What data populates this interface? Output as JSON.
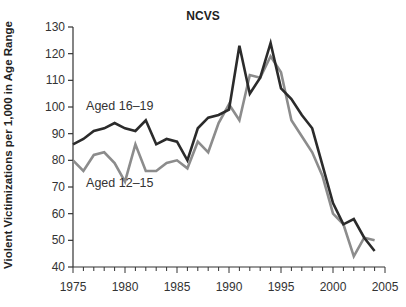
{
  "chart_data": {
    "type": "line",
    "title": "NCVS",
    "xlabel": "",
    "ylabel": "Violent Victimizations per 1,000 in Age Range",
    "xlim": [
      1975,
      2005
    ],
    "ylim": [
      40,
      130
    ],
    "x_ticks": [
      1975,
      1980,
      1985,
      1990,
      1995,
      2000,
      2005
    ],
    "y_ticks": [
      40,
      50,
      60,
      70,
      80,
      90,
      100,
      110,
      120,
      130
    ],
    "grid": false,
    "legend": "inline labels",
    "x": [
      1975,
      1976,
      1977,
      1978,
      1979,
      1980,
      1981,
      1982,
      1983,
      1984,
      1985,
      1986,
      1987,
      1988,
      1989,
      1990,
      1991,
      1992,
      1993,
      1994,
      1995,
      1996,
      1997,
      1998,
      1999,
      2000,
      2001,
      2002,
      2003,
      2004
    ],
    "series": [
      {
        "name": "Aged 16–19",
        "color": "#2b2b2b",
        "values": [
          86,
          88,
          91,
          92,
          94,
          92,
          91,
          95,
          86,
          88,
          87,
          80,
          92,
          96,
          97,
          99,
          123,
          105,
          111,
          124,
          107,
          103,
          97,
          92,
          78,
          64,
          56,
          58,
          51,
          46
        ]
      },
      {
        "name": "Aged 12–15",
        "color": "#8c8c8c",
        "values": [
          80,
          76,
          82,
          83,
          79,
          72,
          86,
          76,
          76,
          79,
          80,
          77,
          87,
          83,
          94,
          101,
          95,
          112,
          111,
          119,
          113,
          95,
          89,
          83,
          74,
          60,
          56,
          44,
          51,
          50
        ]
      }
    ],
    "annotations": [
      {
        "text": "Aged 16–19",
        "x": 1979.5,
        "y": 99
      },
      {
        "text": "Aged 12–15",
        "x": 1979.5,
        "y": 70
      }
    ]
  }
}
